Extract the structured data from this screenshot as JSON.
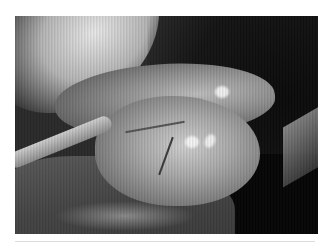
{
  "figure": {
    "alt": "Grayscale intraoperative photograph showing a rounded organ mass surrounded by surgical drapes",
    "colors": {
      "background": "#ffffff",
      "divider": "#dcdcdc"
    }
  }
}
